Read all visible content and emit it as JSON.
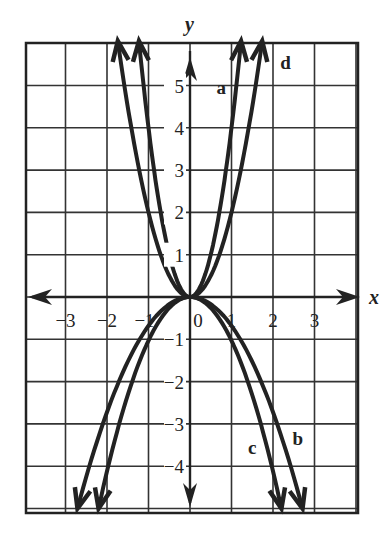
{
  "chart_data": {
    "type": "line",
    "title": "",
    "xlabel": "x",
    "ylabel": "y",
    "xlim": [
      -3.95,
      4.0
    ],
    "ylim": [
      -5.1,
      6.0
    ],
    "grid": true,
    "x_ticks": [
      "-3",
      "-2",
      "-1",
      "0",
      "1",
      "2",
      "3"
    ],
    "y_ticks": [
      "5",
      "4",
      "3",
      "2",
      "1",
      "-1",
      "-2",
      "-3",
      "-4"
    ],
    "series": [
      {
        "name": "a",
        "formula": "y = 4x^2",
        "coef": 4,
        "direction": "up",
        "label_pos": [
          0.75,
          4.8
        ]
      },
      {
        "name": "d",
        "formula": "y = 2x^2",
        "coef": 2,
        "direction": "up",
        "label_pos": [
          2.3,
          5.4
        ]
      },
      {
        "name": "c",
        "formula": "y = -x^2",
        "coef": -1.03,
        "direction": "down",
        "label_pos": [
          1.5,
          -3.7
        ]
      },
      {
        "name": "b",
        "formula": "y = -0.7x^2",
        "coef": -0.68,
        "direction": "down",
        "label_pos": [
          2.6,
          -3.5
        ]
      }
    ]
  },
  "axis": {
    "x_label": "x",
    "y_label": "y"
  },
  "labels": {
    "a": "a",
    "b": "b",
    "c": "c",
    "d": "d"
  },
  "ticks": {
    "x": [
      "−3",
      "−2",
      "−1",
      "0",
      "1",
      "2",
      "3"
    ],
    "y": [
      "5",
      "4",
      "3",
      "2",
      "1",
      "−1",
      "−2",
      "−3",
      "−4"
    ]
  }
}
